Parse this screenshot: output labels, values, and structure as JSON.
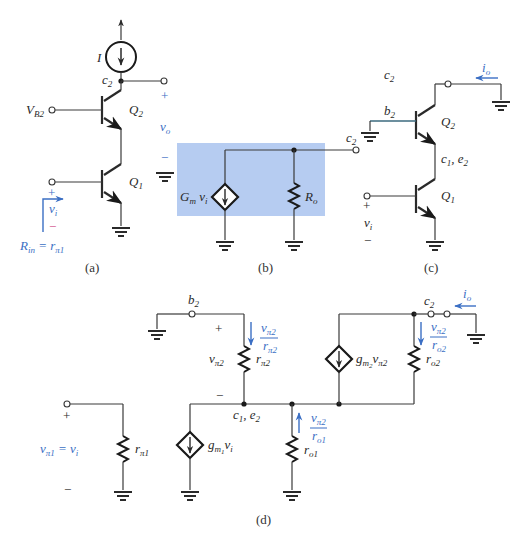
{
  "figure": {
    "panels": [
      {
        "id": "a",
        "caption": "(a)",
        "labels": {
          "current_source": "I",
          "node_c2": "c",
          "node_c2_sub": "2",
          "bias_voltage": "V",
          "bias_voltage_sub": "B2",
          "q2": "Q",
          "q2_sub": "2",
          "q1": "Q",
          "q1_sub": "1",
          "output_plus": "+",
          "output_voltage": "v",
          "output_voltage_sub": "o",
          "output_minus": "−",
          "input_plus": "+",
          "input_voltage": "v",
          "input_voltage_sub": "i",
          "input_minus": "−",
          "rin_label": "R",
          "rin_sub": "in",
          "rin_eq": " = r",
          "rin_eq_sub": "π1"
        }
      },
      {
        "id": "b",
        "caption": "(b)",
        "labels": {
          "source": "G",
          "source_sub": "m",
          "source_var": " v",
          "source_var_sub": "i",
          "resistor": "R",
          "resistor_sub": "o",
          "node_c2": "c",
          "node_c2_sub": "2"
        }
      },
      {
        "id": "c",
        "caption": "(c)",
        "labels": {
          "node_c2": "c",
          "node_c2_sub": "2",
          "output_current": "i",
          "output_current_sub": "o",
          "node_b2": "b",
          "node_b2_sub": "2",
          "q2": "Q",
          "q2_sub": "2",
          "node_c1e2": "c",
          "node_c1e2_sub1": "1",
          "node_c1e2_mid": ", e",
          "node_c1e2_sub2": "2",
          "q1": "Q",
          "q1_sub": "1",
          "input_plus": "+",
          "input_voltage": "v",
          "input_voltage_sub": "i",
          "input_minus": "−"
        }
      },
      {
        "id": "d",
        "caption": "(d)",
        "labels": {
          "node_b2": "b",
          "node_b2_sub": "2",
          "vpi2_plus": "+",
          "vpi2_minus": "−",
          "vpi2": "v",
          "vpi2_sub": "π2",
          "rpi2": "r",
          "rpi2_sub": "π2",
          "i_rpi2_num": "v",
          "i_rpi2_num_sub": "π2",
          "i_rpi2_den": "r",
          "i_rpi2_den_sub": "π2",
          "node_c1e2": "c",
          "node_c1e2_sub1": "1",
          "node_c1e2_mid": ", e",
          "node_c1e2_sub2": "2",
          "gm1_source": "g",
          "gm1_sub": "m",
          "gm1_subsub": "1",
          "gm1_var": "v",
          "gm1_var_sub": "i",
          "ro1": "r",
          "ro1_sub": "o1",
          "i_ro1_num": "v",
          "i_ro1_num_sub": "π2",
          "i_ro1_den": "r",
          "i_ro1_den_sub": "o1",
          "gm2_source": "g",
          "gm2_sub": "m",
          "gm2_subsub": "2",
          "gm2_var": "v",
          "gm2_var_sub": "π2",
          "ro2": "r",
          "ro2_sub": "o2",
          "i_ro2_num": "v",
          "i_ro2_num_sub": "π2",
          "i_ro2_den": "r",
          "i_ro2_den_sub": "o2",
          "node_c2": "c",
          "node_c2_sub": "2",
          "output_current": "i",
          "output_current_sub": "o",
          "vpi1_plus": "+",
          "vpi1_minus": "−",
          "vpi1": "v",
          "vpi1_sub": "π1",
          "vpi1_eq": " = v",
          "vpi1_eq_sub": "i",
          "rpi1": "r",
          "rpi1_sub": "π1"
        }
      }
    ],
    "colors": {
      "wire": "#3a3a3a",
      "annotation_blue": "#3b6fc4",
      "minus_pink": "#d0508a",
      "highlight_box": "#a9c3ee"
    }
  }
}
